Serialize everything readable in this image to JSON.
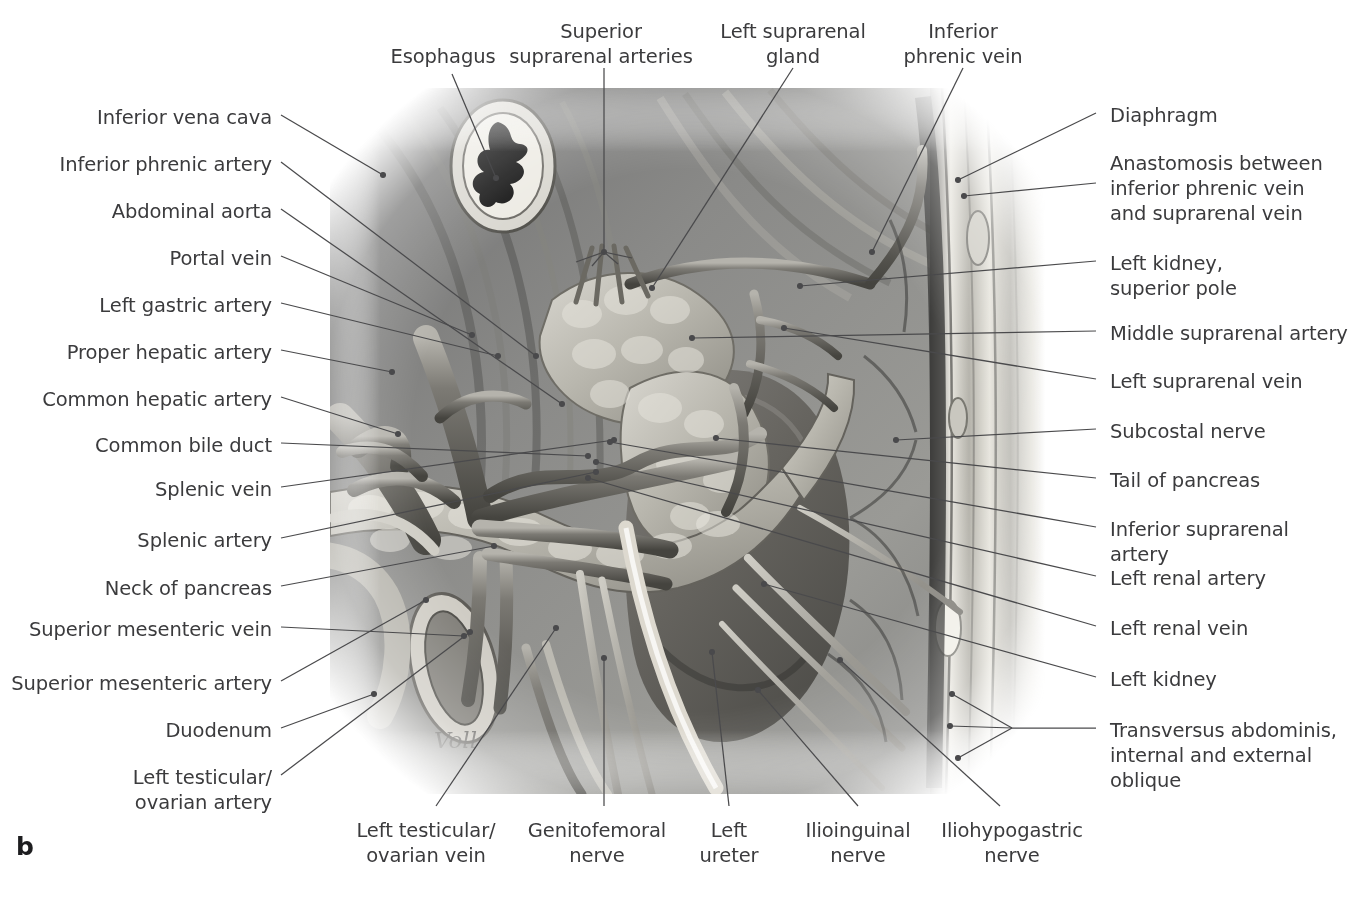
{
  "figure": {
    "letter": "b",
    "artist_signature": "Voll"
  },
  "colors": {
    "label_text": "#3b3b3d",
    "leader_line": "#4a4a4c",
    "figure_letter": "#1d1d1f",
    "background": "#ffffff"
  },
  "labels_top": [
    {
      "id": "esophagus",
      "text": "Esophagus",
      "x": 443,
      "y": 44,
      "align": "center"
    },
    {
      "id": "superior-suprarenal-arteries",
      "text": "Superior\nsuprarenal arteries",
      "x": 601,
      "y": 19,
      "align": "center"
    },
    {
      "id": "left-suprarenal-gland",
      "text": "Left suprarenal\ngland",
      "x": 793,
      "y": 19,
      "align": "center"
    },
    {
      "id": "inferior-phrenic-vein",
      "text": "Inferior\nphrenic vein",
      "x": 963,
      "y": 19,
      "align": "center"
    }
  ],
  "labels_left": [
    {
      "id": "inferior-vena-cava",
      "text": "Inferior vena cava",
      "y": 109
    },
    {
      "id": "inferior-phrenic-artery",
      "text": "Inferior phrenic artery",
      "y": 156
    },
    {
      "id": "abdominal-aorta",
      "text": "Abdominal aorta",
      "y": 203
    },
    {
      "id": "portal-vein",
      "text": "Portal vein",
      "y": 250
    },
    {
      "id": "left-gastric-artery",
      "text": "Left gastric artery",
      "y": 297
    },
    {
      "id": "proper-hepatic-artery",
      "text": "Proper hepatic artery",
      "y": 344
    },
    {
      "id": "common-hepatic-artery",
      "text": "Common hepatic artery",
      "y": 391
    },
    {
      "id": "common-bile-duct",
      "text": "Common bile duct",
      "y": 437
    },
    {
      "id": "splenic-vein",
      "text": "Splenic vein",
      "y": 481
    },
    {
      "id": "splenic-artery",
      "text": "Splenic artery",
      "y": 532
    },
    {
      "id": "neck-of-pancreas",
      "text": "Neck of pancreas",
      "y": 580
    },
    {
      "id": "superior-mesenteric-vein",
      "text": "Superior mesenteric vein",
      "y": 621
    },
    {
      "id": "superior-mesenteric-artery",
      "text": "Superior mesenteric artery",
      "y": 675
    },
    {
      "id": "duodenum",
      "text": "Duodenum",
      "y": 722
    },
    {
      "id": "left-testicular-ovarian-artery",
      "text": "Left testicular/\novarian artery",
      "y": 769
    }
  ],
  "labels_right": [
    {
      "id": "diaphragm",
      "text": "Diaphragm",
      "y": 107
    },
    {
      "id": "anastomosis-phrenic-suprarenal",
      "text": "Anastomosis between\ninferior phrenic vein\nand suprarenal vein",
      "y": 155
    },
    {
      "id": "left-kidney-superior-pole",
      "text": "Left kidney,\nsuperior pole",
      "y": 255
    },
    {
      "id": "middle-suprarenal-artery",
      "text": "Middle suprarenal artery",
      "y": 325
    },
    {
      "id": "left-suprarenal-vein",
      "text": "Left suprarenal vein",
      "y": 373
    },
    {
      "id": "subcostal-nerve",
      "text": "Subcostal nerve",
      "y": 423
    },
    {
      "id": "tail-of-pancreas",
      "text": "Tail of pancreas",
      "y": 472
    },
    {
      "id": "inferior-suprarenal-artery",
      "text": "Inferior suprarenal artery",
      "y": 521
    },
    {
      "id": "left-renal-artery",
      "text": "Left renal artery",
      "y": 570
    },
    {
      "id": "left-renal-vein",
      "text": "Left renal vein",
      "y": 620
    },
    {
      "id": "left-kidney",
      "text": "Left kidney",
      "y": 671
    },
    {
      "id": "transversus-abdominis-obliques",
      "text": "Transversus abdominis,\ninternal and external\noblique",
      "y": 722
    }
  ],
  "labels_bottom": [
    {
      "id": "left-testicular-ovarian-vein",
      "text": "Left testicular/\novarian vein",
      "x": 426,
      "y": 818
    },
    {
      "id": "genitofemoral-nerve",
      "text": "Genitofemoral\nnerve",
      "x": 597,
      "y": 818
    },
    {
      "id": "left-ureter",
      "text": "Left\nureter",
      "x": 729,
      "y": 818
    },
    {
      "id": "ilioinguinal-nerve",
      "text": "Ilioinguinal\nnerve",
      "x": 858,
      "y": 818
    },
    {
      "id": "iliohypogastric-nerve",
      "text": "Iliohypogastric\nnerve",
      "x": 1012,
      "y": 818
    }
  ],
  "illustration": {
    "name": "left-retroperitoneum-anatomical-drawing",
    "style": "grayscale airbrush medical illustration",
    "bounds": {
      "x": 345,
      "y": 95,
      "width": 690,
      "height": 695
    },
    "structures": [
      "esophagus cross-section",
      "diaphragm crura",
      "abdominal aorta",
      "inferior vena cava",
      "celiac trunk branches",
      "left suprarenal gland",
      "left kidney",
      "pancreas body and tail",
      "duodenum",
      "left ureter",
      "lumbar plexus nerves",
      "abdominal wall muscle layers"
    ]
  }
}
